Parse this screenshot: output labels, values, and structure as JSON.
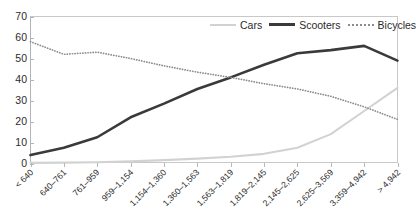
{
  "chart_data": {
    "type": "line",
    "title": "",
    "xlabel": "",
    "ylabel": "",
    "ylim": [
      0,
      70
    ],
    "ytick_step": 10,
    "yticks": [
      "70",
      "60",
      "50",
      "40",
      "30",
      "20",
      "10",
      "0"
    ],
    "grid": false,
    "legend_position": "top-right",
    "categories": [
      "< 640",
      "640–761",
      "761–959",
      "959–1,154",
      "1,154–1,360",
      "1,360–1,563",
      "1,563–1,819",
      "1,819–2,145",
      "2,145–2,625",
      "2,625–3,569",
      "3,359–4,942",
      "> 4,942"
    ],
    "series": [
      {
        "name": "Cars",
        "color": "#d2d2d2",
        "style": "solid",
        "values": [
          0.3,
          0.4,
          0.6,
          1.0,
          1.6,
          2.3,
          3.2,
          4.6,
          7.5,
          14.0,
          25.0,
          36.0
        ]
      },
      {
        "name": "Scooters",
        "color": "#3a3a3a",
        "style": "solid",
        "values": [
          4.0,
          7.5,
          12.5,
          22.0,
          28.5,
          35.5,
          41.0,
          47.0,
          52.5,
          54.0,
          56.0,
          49.0
        ]
      },
      {
        "name": "Bicycles",
        "color": "#8c8c8c",
        "style": "dotted",
        "values": [
          58.0,
          52.0,
          53.0,
          50.0,
          46.5,
          43.5,
          41.0,
          38.0,
          35.5,
          32.0,
          27.0,
          21.0
        ]
      }
    ]
  },
  "legend": {
    "items": [
      {
        "label": "Cars"
      },
      {
        "label": "Scooters"
      },
      {
        "label": "Bicycles"
      }
    ]
  },
  "colors": {
    "cars": "#d2d2d2",
    "scooters": "#3a3a3a",
    "bicycles": "#8c8c8c",
    "axis": "#b4b4b4",
    "text": "#2b2b2b",
    "background": "#ffffff"
  }
}
